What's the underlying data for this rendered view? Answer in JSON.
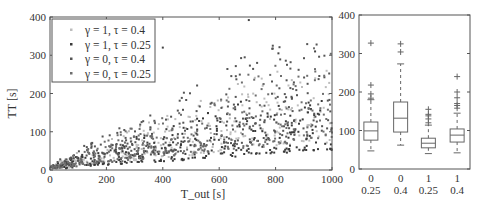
{
  "chart_data": [
    {
      "type": "scatter",
      "title": "",
      "xlabel": "T_out [s]",
      "ylabel": "TT [s]",
      "xlim": [
        0,
        1000
      ],
      "ylim": [
        0,
        400
      ],
      "xticks": [
        0,
        200,
        400,
        600,
        800,
        1000
      ],
      "yticks": [
        0,
        100,
        200,
        300,
        400
      ],
      "grid": false,
      "legend_position": "upper left",
      "series": [
        {
          "name": "γ = 1, τ = 0.4",
          "color": "#bdbdbd",
          "n": 300,
          "lower_slope": 0.07,
          "upper_slope": 0.33,
          "cap": 260,
          "seed": 11
        },
        {
          "name": "γ = 1, τ = 0.25",
          "color": "#3a3a3a",
          "n": 300,
          "lower_slope": 0.05,
          "upper_slope": 0.26,
          "cap": 180,
          "seed": 23
        },
        {
          "name": "γ = 0, τ = 0.4",
          "color": "#555555",
          "n": 300,
          "lower_slope": 0.1,
          "upper_slope": 0.42,
          "cap": 330,
          "seed": 37
        },
        {
          "name": "γ = 0, τ = 0.25",
          "color": "#6e6e6e",
          "n": 300,
          "lower_slope": 0.08,
          "upper_slope": 0.35,
          "cap": 330,
          "seed": 53
        }
      ],
      "notable_points": [
        [
          705,
          392
        ],
        [
          400,
          320
        ],
        [
          280,
          270
        ],
        [
          810,
          305
        ],
        [
          940,
          310
        ]
      ]
    },
    {
      "type": "box",
      "title": "",
      "xlabel": "",
      "ylabel": "",
      "ylim": [
        0,
        400
      ],
      "yticks": [
        0,
        100,
        200,
        300,
        400
      ],
      "categories": [
        [
          "0",
          "0.25"
        ],
        [
          "0",
          "0.4"
        ],
        [
          "1",
          "0.25"
        ],
        [
          "1",
          "0.4"
        ]
      ],
      "boxes": [
        {
          "whisker_low": 47,
          "q1": 75,
          "median": 99,
          "q3": 122,
          "whisker_high": 180,
          "outliers": [
            184,
            195,
            218,
            327
          ]
        },
        {
          "whisker_low": 62,
          "q1": 96,
          "median": 132,
          "q3": 174,
          "whisker_high": 273,
          "outliers": [
            304,
            325
          ]
        },
        {
          "whisker_low": 40,
          "q1": 55,
          "median": 67,
          "q3": 80,
          "whisker_high": 114,
          "outliers": [
            120,
            130,
            138,
            142,
            155
          ]
        },
        {
          "whisker_low": 42,
          "q1": 70,
          "median": 88,
          "q3": 104,
          "whisker_high": 145,
          "outliers": [
            158,
            165,
            170,
            185,
            200,
            240
          ]
        }
      ]
    }
  ]
}
